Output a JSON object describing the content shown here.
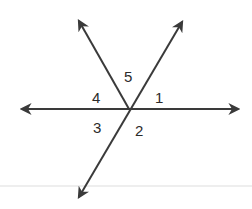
{
  "diagram": {
    "type": "intersecting-lines-angles",
    "intersection": {
      "x": 129,
      "y": 109
    },
    "colors": {
      "line": "#3a3a3a",
      "text": "#2b2b2b",
      "faint_rule": "#e6e6e6"
    },
    "lines": [
      {
        "name": "horizontal-line",
        "from": {
          "x": 20,
          "y": 109
        },
        "to": {
          "x": 240,
          "y": 109
        }
      },
      {
        "name": "upper-left-ray-line",
        "from": {
          "x": 129,
          "y": 109
        },
        "to": {
          "x": 77,
          "y": 18
        }
      },
      {
        "name": "diagonal-line",
        "from": {
          "x": 77,
          "y": 200
        },
        "to": {
          "x": 184,
          "y": 19
        }
      }
    ],
    "angle_labels": [
      {
        "id": "1",
        "text": "1",
        "x": 155,
        "y": 103
      },
      {
        "id": "2",
        "text": "2",
        "x": 135,
        "y": 136
      },
      {
        "id": "3",
        "text": "3",
        "x": 93,
        "y": 133
      },
      {
        "id": "4",
        "text": "4",
        "x": 92,
        "y": 103
      },
      {
        "id": "5",
        "text": "5",
        "x": 124,
        "y": 82
      }
    ]
  }
}
